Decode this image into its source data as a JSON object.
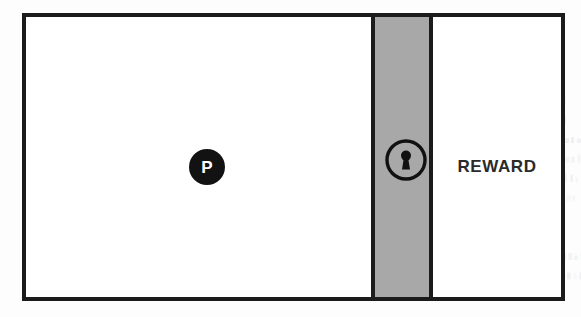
{
  "diagram": {
    "background_color": "#fdfdfd",
    "frame": {
      "name": "environment-boundary",
      "border_color": "#1b1b1b",
      "fill_color": "#ffffff"
    },
    "left_room": {
      "label": "",
      "fill_color": "#ffffff"
    },
    "door": {
      "label": "",
      "fill_color": "#a8a8a8",
      "border_color": "#1b1b1b",
      "state": "locked",
      "icon": "keyhole-icon"
    },
    "right_room": {
      "label": "REWARD",
      "fill_color": "#ffffff",
      "text_color": "#2a2a2a"
    },
    "agent": {
      "label": "P",
      "fill_color": "#121212",
      "text_color": "#ffffff",
      "icon": "agent-token-icon"
    }
  }
}
